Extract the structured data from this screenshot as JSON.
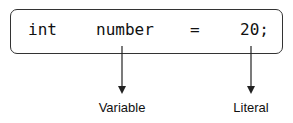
{
  "statement": {
    "tokens": [
      {
        "text": "int",
        "x": 28
      },
      {
        "text": "number",
        "x": 96
      },
      {
        "text": "=",
        "x": 190
      },
      {
        "text": "20;",
        "x": 240
      }
    ]
  },
  "annotations": [
    {
      "label": "Variable",
      "target": "number",
      "x": 122
    },
    {
      "label": "Literal",
      "target": "20",
      "x": 251
    }
  ],
  "colors": {
    "stroke": "#333333",
    "text": "#111111"
  }
}
